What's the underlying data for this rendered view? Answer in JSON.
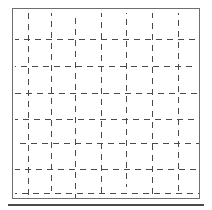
{
  "figure": {
    "title": "Dashed grid figure",
    "background_color": "#ffffff",
    "line_color": "#4a4a4a",
    "frame_color": "#6e6e6e",
    "baseline_color": "#4a4a4a",
    "canvas": {
      "width": 212,
      "height": 210
    }
  },
  "frame": {
    "name": "figure-frame",
    "x": 12,
    "y": 8,
    "width": 188,
    "height": 191,
    "border_width": 1
  },
  "baseline_rule": {
    "name": "baseline-rule",
    "x": 8,
    "y": 204,
    "width": 196,
    "height": 2
  },
  "grid": {
    "area": {
      "x": 13,
      "y": 9,
      "width": 186,
      "height": 189
    },
    "dash_length": 6,
    "dash_gap": 5,
    "line_thickness": 1,
    "vertical_count": 7,
    "horizontal_count": 7,
    "vertical_lines": [
      {
        "id": "v1",
        "x": 15,
        "y_start": 4,
        "y_end": 186,
        "phase": 0
      },
      {
        "id": "v2",
        "x": 38,
        "y_start": 4,
        "y_end": 182,
        "phase": 3
      },
      {
        "id": "v3",
        "x": 62,
        "y_start": 4,
        "y_end": 189,
        "phase": 6
      },
      {
        "id": "v4",
        "x": 88,
        "y_start": 4,
        "y_end": 189,
        "phase": 2
      },
      {
        "id": "v5",
        "x": 113,
        "y_start": 4,
        "y_end": 178,
        "phase": 5
      },
      {
        "id": "v6",
        "x": 139,
        "y_start": 4,
        "y_end": 186,
        "phase": 1
      },
      {
        "id": "v7",
        "x": 165,
        "y_start": 4,
        "y_end": 186,
        "phase": 4
      }
    ],
    "horizontal_lines": [
      {
        "id": "h1",
        "y": 30,
        "x_start": 2,
        "x_end": 184,
        "phase": 2
      },
      {
        "id": "h2",
        "y": 57,
        "x_start": 2,
        "x_end": 182,
        "phase": 5
      },
      {
        "id": "h3",
        "y": 84,
        "x_start": 2,
        "x_end": 184,
        "phase": 0
      },
      {
        "id": "h4",
        "y": 110,
        "x_start": 2,
        "x_end": 186,
        "phase": 3
      },
      {
        "id": "h5",
        "y": 134,
        "x_start": 2,
        "x_end": 186,
        "phase": 6
      },
      {
        "id": "h6",
        "y": 160,
        "x_start": 2,
        "x_end": 186,
        "phase": 1
      },
      {
        "id": "h7",
        "y": 184,
        "x_start": 2,
        "x_end": 186,
        "phase": 4
      }
    ]
  },
  "chart_data": {
    "type": "grid",
    "title": "",
    "xlabel": "",
    "ylabel": "",
    "grid": true,
    "legend": null,
    "tick_labels_x": [],
    "tick_labels_y": [],
    "vertical_gridlines": 7,
    "horizontal_gridlines": 7,
    "line_style": "dashed",
    "series": []
  }
}
